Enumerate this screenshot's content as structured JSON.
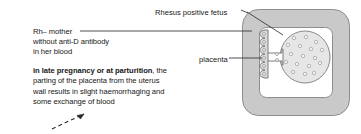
{
  "diagram": {
    "title_visible": false,
    "labels": {
      "fetus": "Rhesus positive fetus",
      "placenta": "placenta",
      "mother_line1": "Rh– mother",
      "mother_line2": "without anti-D antibody",
      "mother_line3": "in her blood"
    },
    "caption": {
      "bold": "in late pregnancy or at parturition",
      "line1_rest": ", the",
      "line2": "parting of the placenta from the uterus",
      "line3": "wall results in slight haemorrhaging and",
      "line4": "some exchange of blood"
    },
    "colors": {
      "uterus_wall_fill": "#c9c9c9",
      "uterus_wall_stroke": "#8a8a8a",
      "uterus_cavity_fill": "#ffffff",
      "fetus_fill": "#e3e3e3",
      "fetus_stroke": "#8a8a8a",
      "fetus_cell_fill": "#f2f2f2",
      "fetus_cell_stroke": "#9a9a9a",
      "placenta_fill": "#d8d8d8",
      "placenta_stroke": "#7d7d7d",
      "leader_line": "#3a3a3a",
      "arrow": "#2b2b2b",
      "text": "#171717"
    },
    "shapes": {
      "uterus": "rounded-square-wall",
      "fetus": "oval-with-blood-cells",
      "fetus_cell_count": 17,
      "placenta": "wavy-villi-strip",
      "placenta_cell_count": 6,
      "blood_flow_arrow": "dashed-diagonal-up-right"
    },
    "icons": {
      "fetus_leader": "leader-line-icon",
      "placenta_leader": "leader-line-icon",
      "mother_leader": "leader-line-icon",
      "blood_arrow": "dashed-arrow-icon"
    }
  }
}
